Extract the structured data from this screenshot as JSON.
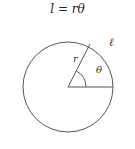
{
  "formula": {
    "text": "l = rθ"
  },
  "diagram": {
    "circle": {
      "cx": 68,
      "cy": 87,
      "r": 45,
      "stroke": "#555555"
    },
    "radius_label": "r",
    "angle_label": "θ",
    "arc_label": "ℓ",
    "radius_line": {
      "x1": 68,
      "y1": 87,
      "x2": 90,
      "y2": 44
    },
    "base_line": {
      "x1": 68,
      "y1": 87,
      "x2": 113,
      "y2": 87
    },
    "line_color": "#555555"
  }
}
